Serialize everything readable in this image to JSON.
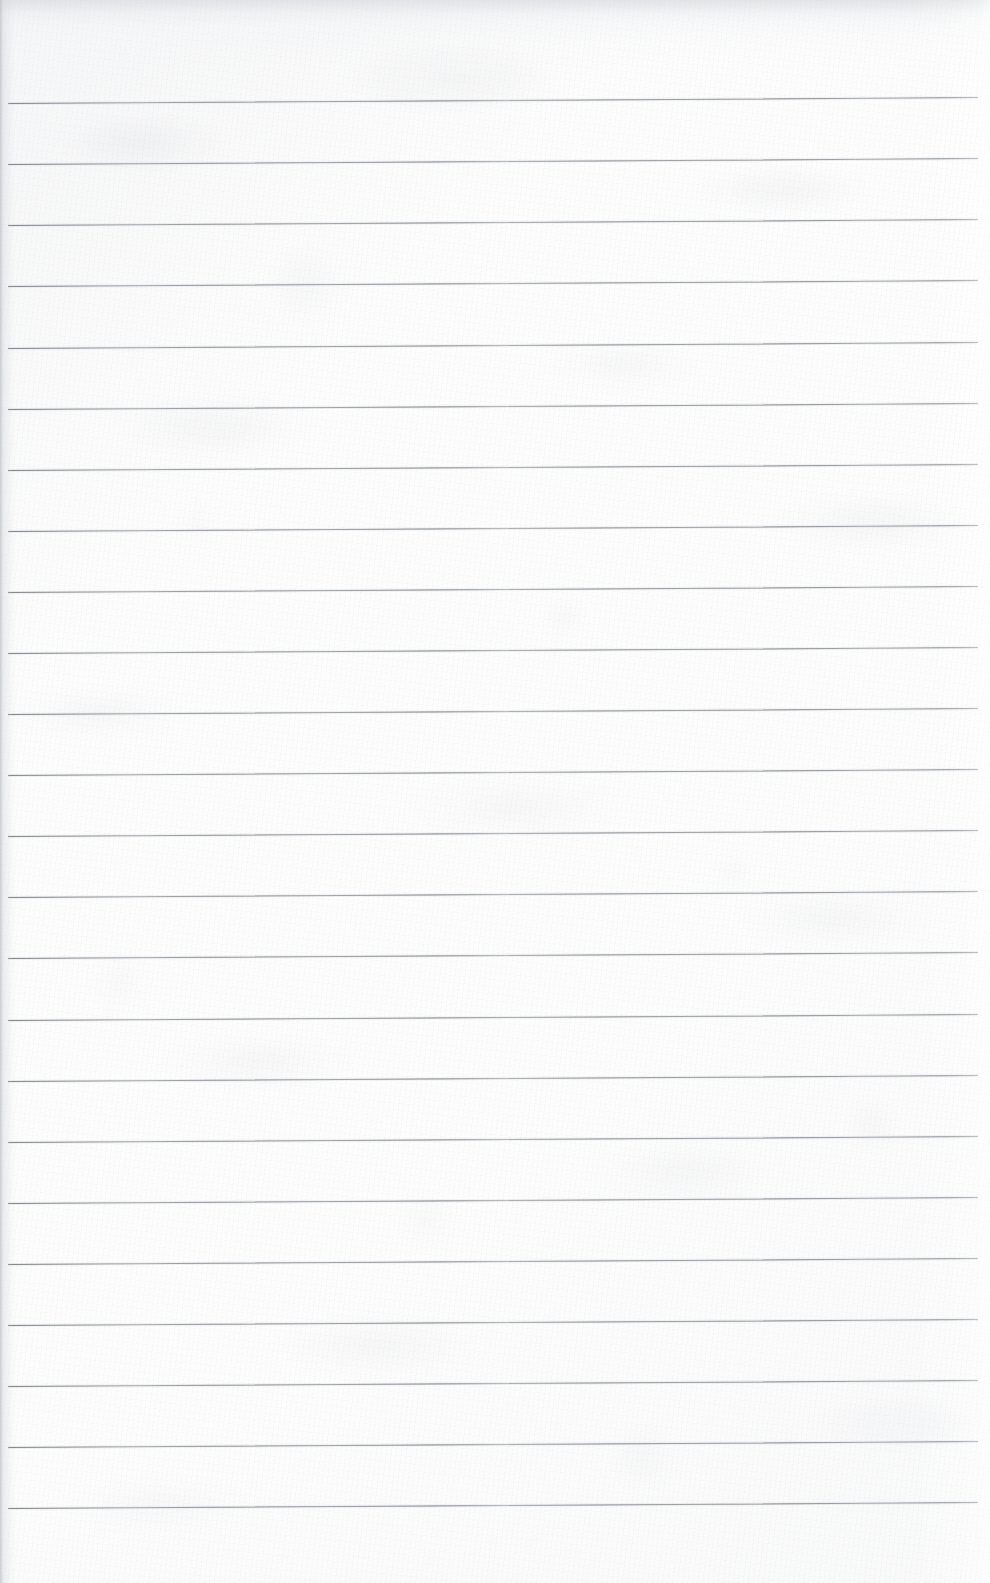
{
  "document": {
    "kind": "scanned-ruled-notebook-page",
    "title": "Blank ruled notebook page",
    "text_content": "",
    "handwriting_present": false,
    "printed_text_present": false,
    "canvas": {
      "width_px": 990,
      "height_px": 1583
    },
    "paper": {
      "base_color": "#fdfdfd",
      "texture_tone": "#c9ccd1",
      "top_edge_shadow": "#cdd0d5",
      "left_edge_shadow": "#aaaeb4",
      "right_edge_highlight": "#ffffff"
    },
    "ruling": {
      "style": "wide-ruled horizontal lines",
      "line_color": "#7e8288",
      "line_thickness_px": 1.3,
      "line_count": 24,
      "first_line_y_px": 103,
      "last_line_y_px": 1508,
      "spacing_px": 61.1,
      "left_inset_px": 8,
      "right_inset_px": 12,
      "skew_deg": -0.35,
      "margin_rule_present": false,
      "lines": [
        {
          "index": 1,
          "y_px": 103
        },
        {
          "index": 2,
          "y_px": 164
        },
        {
          "index": 3,
          "y_px": 225
        },
        {
          "index": 4,
          "y_px": 286
        },
        {
          "index": 5,
          "y_px": 348
        },
        {
          "index": 6,
          "y_px": 409
        },
        {
          "index": 7,
          "y_px": 470
        },
        {
          "index": 8,
          "y_px": 531
        },
        {
          "index": 9,
          "y_px": 592
        },
        {
          "index": 10,
          "y_px": 653
        },
        {
          "index": 11,
          "y_px": 714
        },
        {
          "index": 12,
          "y_px": 775
        },
        {
          "index": 13,
          "y_px": 836
        },
        {
          "index": 14,
          "y_px": 897
        },
        {
          "index": 15,
          "y_px": 958
        },
        {
          "index": 16,
          "y_px": 1020
        },
        {
          "index": 17,
          "y_px": 1081
        },
        {
          "index": 18,
          "y_px": 1142
        },
        {
          "index": 19,
          "y_px": 1203
        },
        {
          "index": 20,
          "y_px": 1264
        },
        {
          "index": 21,
          "y_px": 1325
        },
        {
          "index": 22,
          "y_px": 1386
        },
        {
          "index": 23,
          "y_px": 1447
        },
        {
          "index": 24,
          "y_px": 1508
        }
      ]
    }
  }
}
